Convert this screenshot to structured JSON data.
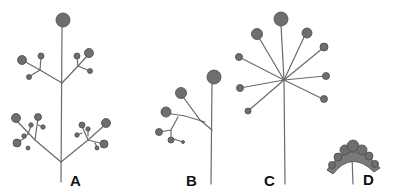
{
  "figure": {
    "type": "inflorescence-diagram",
    "panels": [
      {
        "label": "A",
        "form": "compound branched inflorescence"
      },
      {
        "label": "B",
        "form": "branched inflorescence with few heads"
      },
      {
        "label": "C",
        "form": "umbel"
      },
      {
        "label": "D",
        "form": "capitulum (dense head)"
      }
    ]
  },
  "colors": {
    "stem": "#6a6a6a",
    "head": "#6e6e6e",
    "label": "#111111",
    "background": "#ffffff"
  }
}
